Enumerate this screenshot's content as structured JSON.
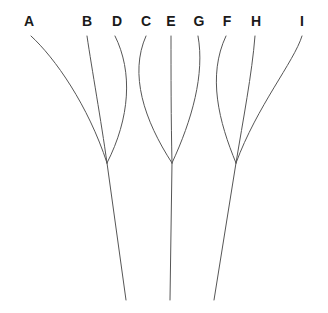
{
  "figure": {
    "title": "",
    "background_color": "#ffffff",
    "width": 328,
    "height": 313
  },
  "style": {
    "edge_color": "#565656",
    "edge_width": 1,
    "label_color": "#1a1a1a",
    "label_font_size": 14
  },
  "leaf_labels": [
    {
      "id": "A",
      "text": "A",
      "x": 29,
      "y": 26,
      "anchor_x": 31,
      "anchor_y": 36
    },
    {
      "id": "B",
      "text": "B",
      "x": 87,
      "y": 26,
      "anchor_x": 87,
      "anchor_y": 36
    },
    {
      "id": "D",
      "text": "D",
      "x": 117,
      "y": 26,
      "anchor_x": 115,
      "anchor_y": 36
    },
    {
      "id": "C",
      "text": "C",
      "x": 146,
      "y": 26,
      "anchor_x": 146,
      "anchor_y": 36
    },
    {
      "id": "E",
      "text": "E",
      "x": 171,
      "y": 26,
      "anchor_x": 171,
      "anchor_y": 36
    },
    {
      "id": "G",
      "text": "G",
      "x": 199,
      "y": 26,
      "anchor_x": 198,
      "anchor_y": 36
    },
    {
      "id": "F",
      "text": "F",
      "x": 227,
      "y": 26,
      "anchor_x": 226,
      "anchor_y": 36
    },
    {
      "id": "H",
      "text": "H",
      "x": 256,
      "y": 26,
      "anchor_x": 255,
      "anchor_y": 36
    },
    {
      "id": "I",
      "text": "I",
      "x": 302,
      "y": 26,
      "anchor_x": 302,
      "anchor_y": 36
    }
  ],
  "internal_nodes": [
    {
      "id": "N1",
      "x": 107,
      "y": 163,
      "children": [
        "A",
        "B",
        "D"
      ],
      "tail_end_x": 126,
      "tail_end_y": 300
    },
    {
      "id": "N2",
      "x": 172,
      "y": 163,
      "children": [
        "C",
        "E",
        "G"
      ],
      "tail_end_x": 170,
      "tail_end_y": 300
    },
    {
      "id": "N3",
      "x": 236,
      "y": 163,
      "children": [
        "F",
        "H",
        "I"
      ],
      "tail_end_x": 214,
      "tail_end_y": 300
    }
  ],
  "edges": [
    {
      "from": "A",
      "to": "N1",
      "path": "M 31 36 C 55 58 88 105 107 163"
    },
    {
      "from": "B",
      "to": "N1",
      "path": "M 87 36 C 92 70 101 120 107 163"
    },
    {
      "from": "D",
      "to": "N1",
      "path": "M 115 36 C 133 72 130 118 107 163"
    },
    {
      "from": "C",
      "to": "N2",
      "path": "M 146 36 C 129 74 144 120 172 163"
    },
    {
      "from": "E",
      "to": "N2",
      "path": "M 171 36 C 171 72 171 120 172 163"
    },
    {
      "from": "G",
      "to": "N2",
      "path": "M 198 36 C 205 74 192 120 172 163"
    },
    {
      "from": "F",
      "to": "N3",
      "path": "M 226 36 C 207 76 219 122 236 163"
    },
    {
      "from": "H",
      "to": "N3",
      "path": "M 255 36 C 252 74 243 120 236 163"
    },
    {
      "from": "I",
      "to": "N3",
      "path": "M 302 36 C 294 62 257 106 236 163"
    },
    {
      "from": "N1",
      "to": "tail1",
      "path": "M 107 163 L 126 300"
    },
    {
      "from": "N2",
      "to": "tail2",
      "path": "M 172 163 L 170 300"
    },
    {
      "from": "N3",
      "to": "tail3",
      "path": "M 236 163 L 214 300"
    }
  ],
  "chart_data": {
    "type": "diagram",
    "subtype": "tree-dendrogram",
    "title": "",
    "xlabel": "",
    "ylabel": "",
    "leaves": [
      "A",
      "B",
      "D",
      "C",
      "E",
      "G",
      "F",
      "H",
      "I"
    ],
    "clusters": [
      {
        "node": "N1",
        "members": [
          "A",
          "B",
          "D"
        ],
        "merge_y": 163
      },
      {
        "node": "N2",
        "members": [
          "C",
          "E",
          "G"
        ],
        "merge_y": 163
      },
      {
        "node": "N3",
        "members": [
          "F",
          "H",
          "I"
        ],
        "merge_y": 163
      }
    ],
    "leaf_x_positions": [
      29,
      87,
      117,
      146,
      171,
      199,
      227,
      256,
      302
    ],
    "node_x_positions": [
      107,
      172,
      236
    ],
    "grid": false,
    "legend": false
  }
}
